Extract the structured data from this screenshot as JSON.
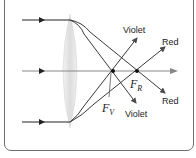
{
  "diagram": {
    "labels": {
      "violet_top": "Violet",
      "red_top": "Red",
      "red_bottom": "Red",
      "violet_bottom": "Violet",
      "focal_red_main": "F",
      "focal_red_sub": "R",
      "focal_violet_main": "F",
      "focal_violet_sub": "V"
    },
    "colors": {
      "ray": "#3a3a3a",
      "axis": "#8a8a8a",
      "lens": "#e6e6e6",
      "frame": "#6e6e6e"
    },
    "incoming_rays": 3,
    "icons": [
      "arrow-right-icon",
      "focal-point-icon"
    ]
  }
}
